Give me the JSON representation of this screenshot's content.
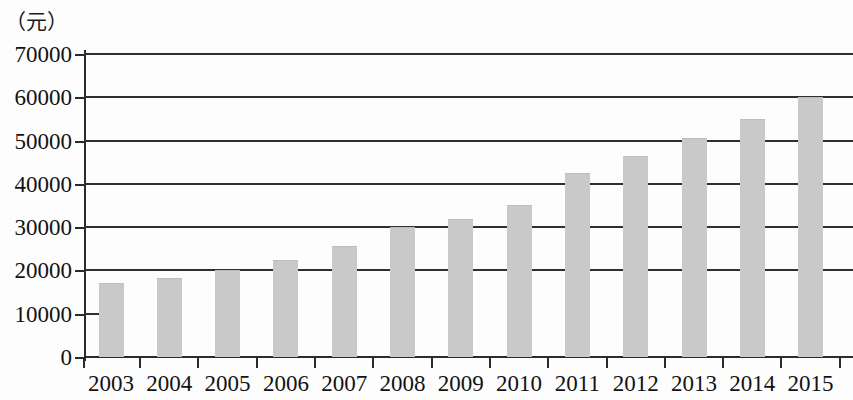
{
  "chart_data": {
    "type": "bar",
    "title": "",
    "subtitle": "",
    "xlabel": "",
    "ylabel": "",
    "unit_caption": "（元）",
    "categories": [
      "2003",
      "2004",
      "2005",
      "2006",
      "2007",
      "2008",
      "2009",
      "2010",
      "2011",
      "2012",
      "2013",
      "2014",
      "2015"
    ],
    "values": [
      17000,
      18200,
      20000,
      22400,
      25600,
      30000,
      32000,
      35200,
      42500,
      46500,
      50700,
      55000,
      60000
    ],
    "ylim": [
      0,
      70000
    ],
    "ytick_values": [
      0,
      10000,
      20000,
      30000,
      40000,
      50000,
      60000,
      70000
    ],
    "ytick_labels": [
      "0",
      "10000",
      "20000",
      "30000",
      "40000",
      "50000",
      "60000",
      "70000"
    ],
    "grid": true,
    "legend": null,
    "legend_position": "none",
    "bar_color": "#c9c9c9",
    "axis_color": "#2b2b2b",
    "text_color": "#121212",
    "background_color": "#fdfdfd",
    "annotations": []
  }
}
